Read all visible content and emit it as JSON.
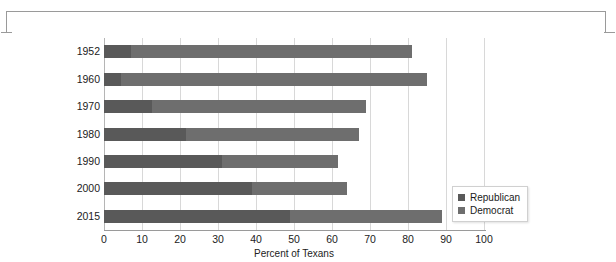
{
  "frame": {
    "bracket_present": true
  },
  "chart_data": {
    "type": "bar",
    "orientation": "horizontal",
    "stacked": true,
    "title": "",
    "xlabel": "Percent of Texans",
    "ylabel": "",
    "xlim": [
      0,
      100
    ],
    "xticks": [
      0,
      10,
      20,
      30,
      40,
      50,
      60,
      70,
      80,
      90,
      100
    ],
    "grid": true,
    "grid_axis": "x",
    "legend_position": "center-right",
    "categories": [
      "1952",
      "1960",
      "1970",
      "1980",
      "1990",
      "2000",
      "2015"
    ],
    "series": [
      {
        "name": "Republican",
        "color": "#595959",
        "values": [
          7,
          4.5,
          12.5,
          21.5,
          31,
          39,
          49
        ]
      },
      {
        "name": "Democrat",
        "color": "#6e6e6e",
        "values": [
          74,
          80.5,
          56.5,
          45.5,
          30.5,
          25,
          40
        ]
      }
    ],
    "totals": [
      81,
      85,
      69,
      67,
      61.5,
      64,
      89
    ]
  },
  "legend": {
    "items": [
      {
        "label": "Republican",
        "color": "#595959"
      },
      {
        "label": "Democrat",
        "color": "#6e6e6e"
      }
    ]
  }
}
